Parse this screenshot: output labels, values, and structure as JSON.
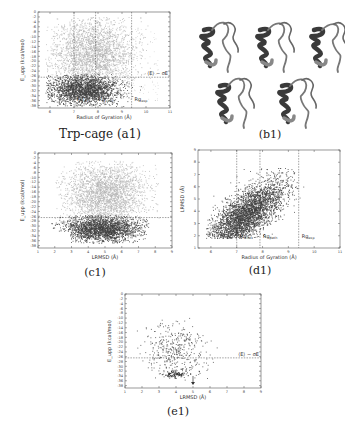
{
  "figure": {
    "captions": {
      "a1": "Trp-cage (a1)",
      "b1": "(b1)",
      "c1": "(c1)",
      "d1": "(d1)",
      "e1": "(e1)"
    },
    "structures_panel": {
      "label": "(b1)",
      "count": 5,
      "description": "Five ribbon-rendered Trp-cage conformations (helix on left, loop on right)"
    }
  },
  "chart_data": [
    {
      "id": "a1",
      "type": "scatter",
      "title": "Trp-cage (a1)",
      "xlabel": "Radius of Gyration (Å)",
      "ylabel": "E_upp (kcal/mol)",
      "xlim": [
        5.5,
        11
      ],
      "ylim": [
        -39,
        0
      ],
      "xticks": [
        6,
        7,
        8,
        9,
        10,
        11
      ],
      "yticks": [
        0,
        -2,
        -4,
        -6,
        -8,
        -10,
        -12,
        -14,
        -16,
        -18,
        -20,
        -22,
        -24,
        -26,
        -28,
        -30,
        -32,
        -34,
        -36,
        -38
      ],
      "vlines": [
        {
          "x": 7.0,
          "label": "Rg_nat"
        },
        {
          "x": 7.9,
          "label": "Rg_path"
        },
        {
          "x": 9.4,
          "label": "Rg_exp"
        }
      ],
      "hline": {
        "y": -26.5,
        "label": "⟨E⟩ − σE"
      },
      "series": [
        {
          "name": "above threshold",
          "color": "#b5b5b5",
          "density": "high",
          "region": "Rg 5.8–10.3, E −35 to −3"
        },
        {
          "name": "below threshold",
          "color": "#4a4a4a",
          "density": "high",
          "region": "Rg 5.8–9.5, E −38 to −26"
        }
      ]
    },
    {
      "id": "c1",
      "type": "scatter",
      "title": "(c1)",
      "xlabel": "LRMSD (Å)",
      "ylabel": "E_upp (kcal/mol)",
      "xlim": [
        1,
        9
      ],
      "ylim": [
        -39,
        0
      ],
      "xticks": [
        1,
        2,
        3,
        4,
        5,
        6,
        7,
        8,
        9
      ],
      "yticks": [
        0,
        -2,
        -4,
        -6,
        -8,
        -10,
        -12,
        -14,
        -16,
        -18,
        -20,
        -22,
        -24,
        -26,
        -28,
        -30,
        -32,
        -34,
        -36,
        -38
      ],
      "hline": {
        "y": -26.5,
        "label": ""
      },
      "series": [
        {
          "name": "above threshold",
          "color": "#b5b5b5",
          "density": "high",
          "region": "LRMSD 2–8, E −30 to −3"
        },
        {
          "name": "below threshold",
          "color": "#4a4a4a",
          "density": "high",
          "region": "LRMSD 1.8–7.5, E −37 to −26"
        }
      ]
    },
    {
      "id": "d1",
      "type": "scatter",
      "title": "(d1)",
      "xlabel": "Radius of Gyration (Å)",
      "ylabel": "LRMSD (Å)",
      "xlim": [
        5.5,
        11
      ],
      "ylim": [
        1,
        9
      ],
      "xticks": [
        6,
        7,
        8,
        9,
        10,
        11
      ],
      "yticks": [
        1,
        2,
        3,
        4,
        5,
        6,
        7,
        8,
        9
      ],
      "vlines": [
        {
          "x": 7.0,
          "label": "Rg_nat"
        },
        {
          "x": 7.9,
          "label": "Rg_path"
        },
        {
          "x": 9.4,
          "label": "Rg_exp"
        }
      ],
      "series": [
        {
          "name": "low-energy conformations",
          "color": "#4a4a4a",
          "density": "high",
          "region": "Rg 5.8–9.5, LRMSD 1.8–7.5, positive correlation"
        }
      ]
    },
    {
      "id": "e1",
      "type": "scatter",
      "title": "(e1)",
      "xlabel": "LRMSD (Å)",
      "ylabel": "E_upp (kcal/mol)",
      "xlim": [
        1,
        9
      ],
      "ylim": [
        -39,
        0
      ],
      "xticks": [
        1,
        2,
        3,
        4,
        5,
        6,
        7,
        8,
        9
      ],
      "yticks": [
        0,
        -2,
        -4,
        -6,
        -8,
        -10,
        -12,
        -14,
        -16,
        -18,
        -20,
        -22,
        -24,
        -26,
        -28,
        -30,
        -32,
        -34,
        -36,
        -38
      ],
      "hline": {
        "y": -26.5,
        "label": "⟨E⟩ − σE"
      },
      "arrow": {
        "x": 5.0,
        "y": -36.5,
        "direction": "down"
      },
      "series": [
        {
          "name": "sampled conformations",
          "color": "#555555",
          "density": "sparse",
          "region": "LRMSD 1.5–7.5, E −36 to −9, cluster near (4, −33)"
        }
      ]
    }
  ]
}
